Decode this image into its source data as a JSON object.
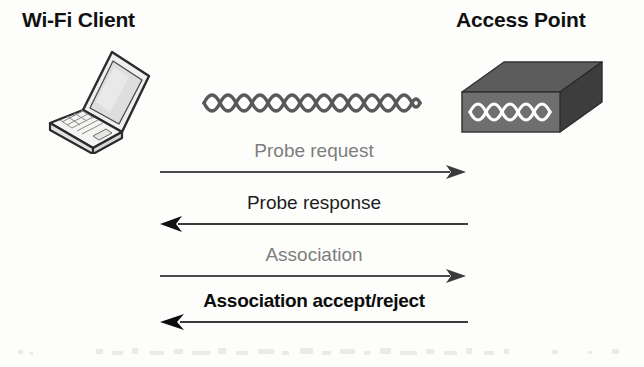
{
  "diagram": {
    "background_color": "#fdfdfc"
  },
  "endpoints": {
    "client": {
      "label": "Wi-Fi Client",
      "icon": "laptop-icon"
    },
    "access_point": {
      "label": "Access Point",
      "icon": "access-point-icon"
    }
  },
  "wireless_signal": {
    "icon": "wireless-wave-icon",
    "color": "#595959"
  },
  "messages": [
    {
      "label": "Probe request",
      "direction": "right",
      "from": "Wi-Fi Client",
      "to": "Access Point",
      "emphasis": "light",
      "color": "#7d7d7d"
    },
    {
      "label": "Probe response",
      "direction": "left",
      "from": "Access Point",
      "to": "Wi-Fi Client",
      "emphasis": "medium",
      "color": "#1d1d1d"
    },
    {
      "label": "Association",
      "direction": "right",
      "from": "Wi-Fi Client",
      "to": "Access Point",
      "emphasis": "light",
      "color": "#7d7d7d"
    },
    {
      "label": "Association accept/reject",
      "direction": "left",
      "from": "Access Point",
      "to": "Wi-Fi Client",
      "emphasis": "bold",
      "color": "#0c0c0c"
    }
  ],
  "palette": {
    "ink": "#111111",
    "arrow_line": "#4a4a4a",
    "ap_top_face": "#5c5c5c",
    "ap_front_face": "#6f6f6f",
    "ap_side_face": "#3d3d3d",
    "laptop_outline": "#2b2b2b",
    "laptop_fill": "#f2f2f0"
  }
}
